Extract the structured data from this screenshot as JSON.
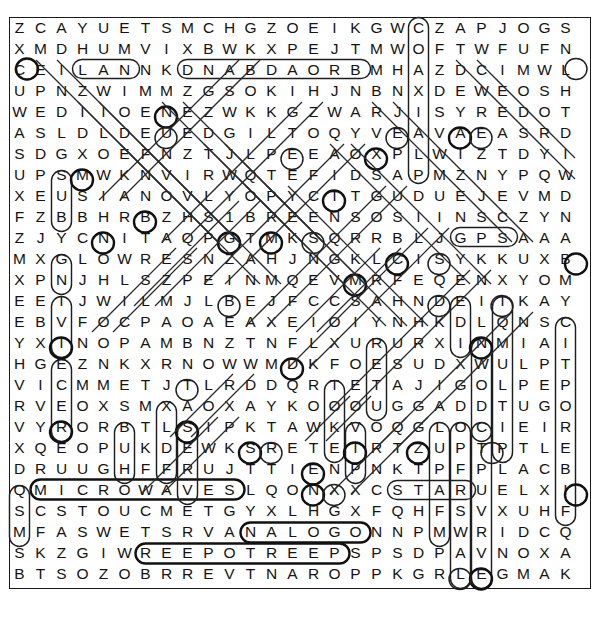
{
  "puzzle": {
    "type": "word-search",
    "title": "Word Search Puzzle",
    "rows": 27,
    "columns": 27,
    "cell_size": 21,
    "grid_origin": {
      "x": 9,
      "y": 17
    },
    "ink_color": "#141414",
    "mark_color": "#1e1e1e",
    "border_color": "#1a1a1a",
    "background_color": "#ffffff",
    "grid": [
      "ZCAYUETSMCHGZOEIKGWCZAPJOGS",
      "XMDHUMVIXBWKXPEJTMWOFTWFUFN",
      "CEILANNKDNABDAORBMHAZDCIMWL",
      "UPNZWIMMZGSOKIHJNBNXDEWEOSH",
      "WEDIIOENEZWKKGZWARJISYREDOT",
      "ASLDLDEUEDGILTOQYVEAVAEASRD",
      "SDGXOEFNZTJLPEEAOXPLWIZTDYI",
      "UPSMWKNVIRWQTEFIDSAPMZNYPQW",
      "XEUSIANOVLYOPYCTTGUDUEJEVMD",
      "FZBBHRBZHS1BREENSOSIINSCZYN",
      "ZJYCNITAQPGTMKSQRRBLJGPSAAA",
      "MXGLOWRESNZAHJNGKLCISYKKUXB",
      "XPNJHLSZPEINMQEVMRFEQENXYOM",
      "EEIJWILMJLBEJFCCSAHNDEITKAY",
      "EBVFOCPAOAEAXEIOIYNHKDLQNSC",
      "YXINOPAMBNZTNFLXURURXINMIAI",
      "HGEZNKXRNOWWMDKFOESUDXWULPT",
      "VICMMETJTLRDDQRTETAJIGOLPEP",
      "RVEOXSMXAOXAYKOOOUGGADDTUGO",
      "VYRORBTLSIPKTAWKVOQGLOCIEIR",
      "XQEOPUKDEWKSRETEIRTZUPTPTLE",
      "DRUUGHFFRUJTTIENPNKTPFPLACB",
      "QMICROWAVESLQONXXCSTARUELXI",
      "SCSTOUCMETGYXLHGXFQHFSVXUHF",
      "MFASWETSRVANALOGONNPMWRIDCQ",
      "SKZGIWREEPOTREEPSPSDPAVNOXA",
      "BTSOZOBRREVTNAROPPKGRLEGMAK"
    ],
    "found_words": [
      "LAN",
      "BROADBAND",
      "GPS",
      "MICROWAVES",
      "STAR",
      "ANALOG",
      "PEERTOPEER",
      "SUB",
      "GN",
      "MULTIPLE"
    ],
    "marks": [
      {
        "kind": "horizontal",
        "label": "LAN",
        "row": 2,
        "col_start": 3,
        "col_end": 5
      },
      {
        "kind": "horizontal",
        "label": "BROADBAND-reversed",
        "row": 2,
        "col_start": 8,
        "col_end": 16
      },
      {
        "kind": "horizontal",
        "label": "GPS",
        "row": 10,
        "col_start": 21,
        "col_end": 23
      },
      {
        "kind": "horizontal",
        "label": "MICROWAVES",
        "row": 22,
        "col_start": 1,
        "col_end": 10
      },
      {
        "kind": "horizontal",
        "label": "STAR",
        "row": 22,
        "col_start": 18,
        "col_end": 21
      },
      {
        "kind": "horizontal",
        "label": "ANALOG",
        "row": 24,
        "col_start": 11,
        "col_end": 16
      },
      {
        "kind": "horizontal",
        "label": "REEPOTREEP",
        "row": 25,
        "col_start": 6,
        "col_end": 15
      },
      {
        "kind": "vertical",
        "label": "SUB",
        "col": 2,
        "row_start": 7,
        "row_end": 9
      },
      {
        "kind": "vertical",
        "label": "GN",
        "col": 2,
        "row_start": 11,
        "row_end": 12
      },
      {
        "kind": "vertical",
        "label": "IVI",
        "col": 2,
        "row_start": 13,
        "row_end": 15
      },
      {
        "kind": "vertical",
        "label": "ECER",
        "col": 2,
        "row_start": 16,
        "row_end": 19
      },
      {
        "kind": "vertical",
        "label": "SMS",
        "col": 0,
        "row_start": 23,
        "row_end": 25
      },
      {
        "kind": "vertical",
        "label": "BUH",
        "col": 5,
        "row_start": 19,
        "row_end": 21
      },
      {
        "kind": "vertical",
        "label": "SEVR",
        "col": 8,
        "row_start": 19,
        "row_end": 22
      },
      {
        "kind": "vertical",
        "label": "column-C",
        "col": 19,
        "row_start": 0,
        "row_end": 7
      },
      {
        "kind": "vertical",
        "label": "EDI",
        "col": 21,
        "row_start": 13,
        "row_end": 15
      },
      {
        "kind": "vertical",
        "label": "RED",
        "col": 17,
        "row_start": 15,
        "row_end": 18
      },
      {
        "kind": "vertical",
        "label": "TOOK",
        "col": 15,
        "row_start": 17,
        "row_end": 20
      },
      {
        "kind": "vertical",
        "label": "MULTI",
        "col": 22,
        "row_start": 15,
        "row_end": 19
      },
      {
        "kind": "vertical",
        "label": "KNILPUE",
        "col": 23,
        "row_start": 13,
        "row_end": 20
      },
      {
        "kind": "vertical",
        "label": "CITPO",
        "col": 26,
        "row_start": 14,
        "row_end": 23
      },
      {
        "kind": "vertical",
        "label": "EXING",
        "col": 21,
        "row_start": 19,
        "row_end": 26
      },
      {
        "kind": "vertical",
        "label": "TLDOM",
        "col": 22,
        "row_start": 19,
        "row_end": 26
      }
    ]
  }
}
